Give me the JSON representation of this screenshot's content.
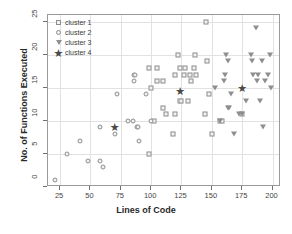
{
  "chart_data": {
    "type": "scatter",
    "title": "",
    "xlabel": "Lines of Code",
    "ylabel": "No. of Functions Executed",
    "xlim": [
      15,
      207
    ],
    "ylim": [
      0,
      26
    ],
    "xticks": [
      25,
      50,
      75,
      100,
      125,
      150,
      175,
      200
    ],
    "yticks": [
      0,
      5,
      10,
      15,
      20,
      25
    ],
    "grid": true,
    "legend_position": "top-left",
    "colors": {
      "marker_edge": "#8e8e8e",
      "marker_fill": "#f2f2f2",
      "star": "#4a4a4a",
      "grid": "#e2e2e2",
      "frame": "#9a9a9a",
      "text": "#3b3b3b"
    },
    "series": [
      {
        "name": "cluster 1",
        "marker": "square",
        "points": [
          [
            98,
            18
          ],
          [
            105,
            18
          ],
          [
            100,
            15
          ],
          [
            105,
            16
          ],
          [
            110,
            16
          ],
          [
            110,
            12
          ],
          [
            112,
            11
          ],
          [
            118,
            8
          ],
          [
            120,
            11
          ],
          [
            122,
            20
          ],
          [
            124,
            18
          ],
          [
            124,
            13
          ],
          [
            125,
            13
          ],
          [
            127,
            17
          ],
          [
            128,
            18
          ],
          [
            130,
            13
          ],
          [
            132,
            17
          ],
          [
            133,
            16
          ],
          [
            135,
            18
          ],
          [
            136,
            20
          ],
          [
            137,
            17
          ],
          [
            145,
            25
          ],
          [
            144,
            11
          ],
          [
            146,
            19
          ],
          [
            148,
            14
          ],
          [
            150,
            8
          ],
          [
            98,
            5
          ],
          [
            102,
            10
          ],
          [
            157,
            10
          ],
          [
            158,
            10
          ],
          [
            175,
            11
          ],
          [
            120,
            17
          ]
        ]
      },
      {
        "name": "cluster 2",
        "marker": "circle",
        "points": [
          [
            21,
            1
          ],
          [
            31,
            5
          ],
          [
            41,
            7
          ],
          [
            48,
            4
          ],
          [
            58,
            4
          ],
          [
            60,
            3
          ],
          [
            58,
            9
          ],
          [
            70,
            8
          ],
          [
            72,
            14
          ],
          [
            81,
            10
          ],
          [
            85,
            10
          ],
          [
            86,
            17
          ],
          [
            87,
            17
          ],
          [
            86,
            16
          ],
          [
            88,
            9
          ],
          [
            89,
            9
          ],
          [
            90,
            7
          ],
          [
            96,
            14
          ],
          [
            100,
            10
          ]
        ]
      },
      {
        "name": "cluster 3",
        "marker": "triangle",
        "points": [
          [
            153,
            15
          ],
          [
            157,
            10
          ],
          [
            160,
            16
          ],
          [
            161,
            17
          ],
          [
            162,
            20
          ],
          [
            163,
            19
          ],
          [
            163,
            12
          ],
          [
            164,
            12
          ],
          [
            166,
            14
          ],
          [
            168,
            8
          ],
          [
            172,
            11
          ],
          [
            178,
            13
          ],
          [
            182,
            20
          ],
          [
            183,
            19
          ],
          [
            184,
            17
          ],
          [
            186,
            24
          ],
          [
            187,
            16
          ],
          [
            188,
            17
          ],
          [
            190,
            13
          ],
          [
            191,
            19
          ],
          [
            192,
            9
          ],
          [
            194,
            16
          ],
          [
            196,
            17
          ],
          [
            198,
            20
          ],
          [
            199,
            15
          ],
          [
            175,
            11
          ]
        ]
      },
      {
        "name": "cluster 4",
        "marker": "star",
        "points": [
          [
            70,
            9
          ],
          [
            124,
            14.5
          ],
          [
            175,
            15
          ]
        ]
      }
    ]
  },
  "legend": {
    "items": [
      {
        "label": "cluster 1",
        "marker": "square"
      },
      {
        "label": "cluster 2",
        "marker": "circle"
      },
      {
        "label": "cluster 3",
        "marker": "triangle"
      },
      {
        "label": "cluster 4",
        "marker": "star"
      }
    ]
  }
}
